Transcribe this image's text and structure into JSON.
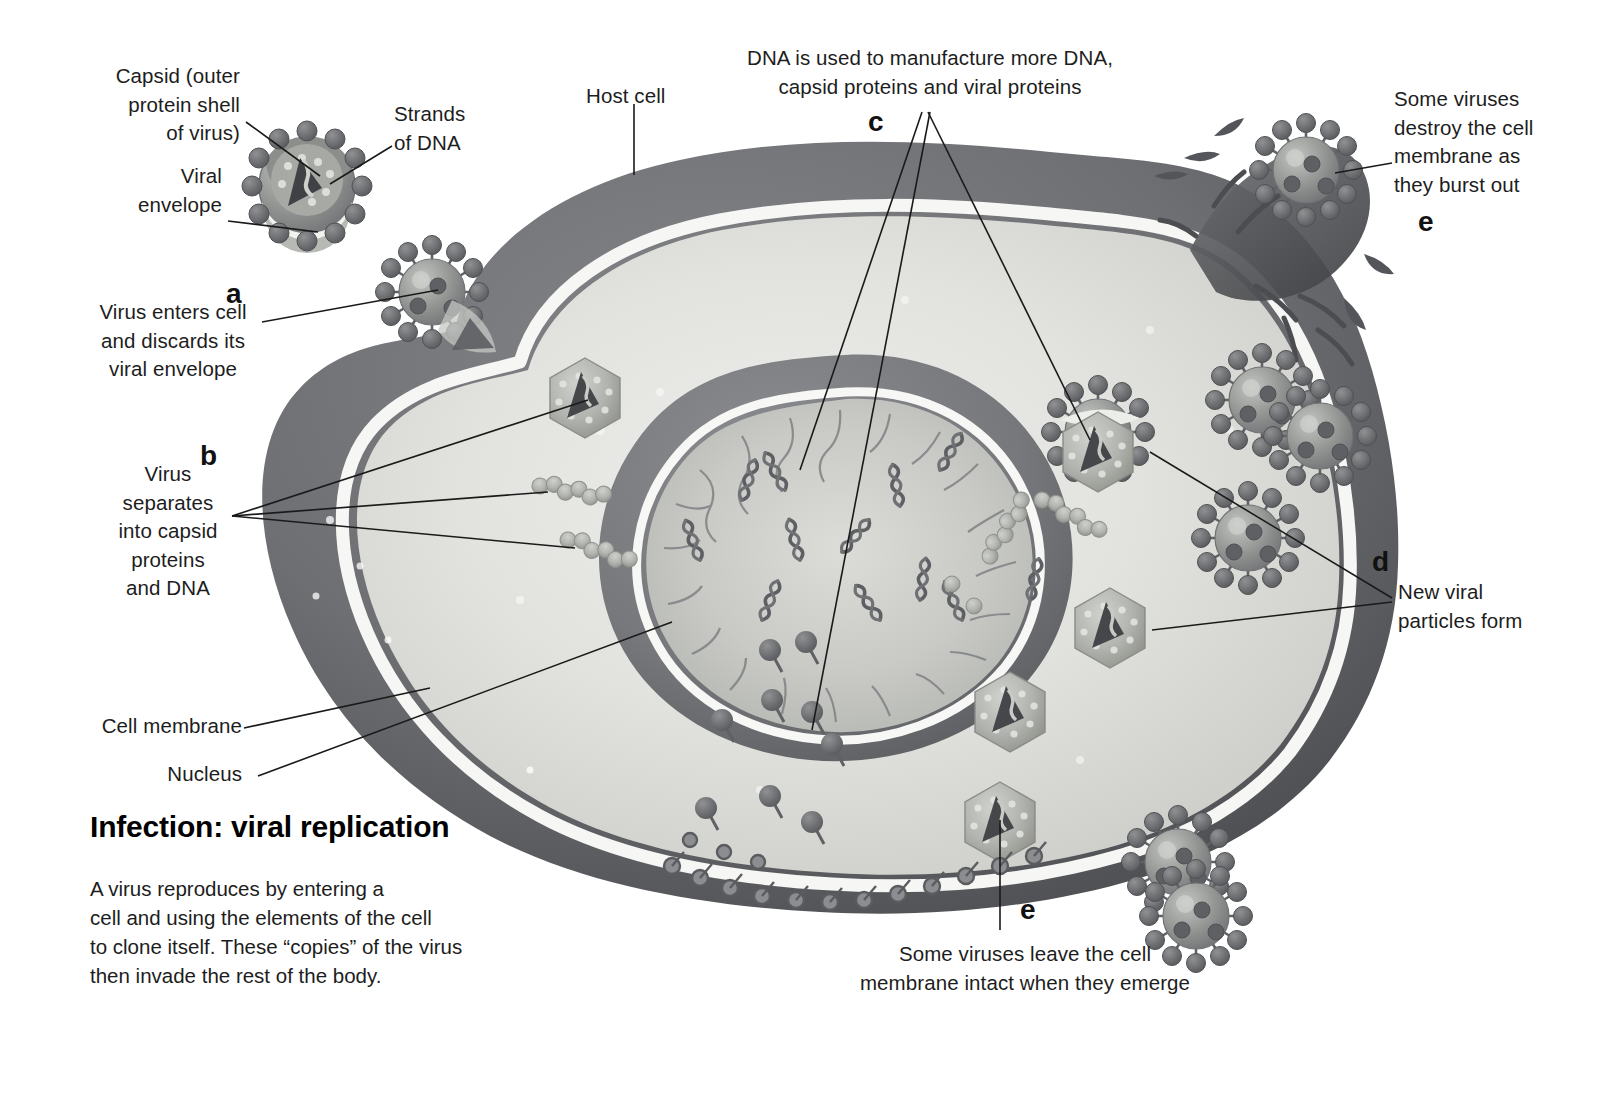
{
  "figure": {
    "title": "Infection: viral replication",
    "description": "A virus reproduces by entering a\ncell and using the elements of the cell\nto clone itself. These “copies” of the virus\nthen invade the rest of the body.",
    "domain": "biology-illustration",
    "palette": {
      "background": "#ffffff",
      "membrane_dark": "#6f7174",
      "membrane_darker": "#56585b",
      "membrane_rim": "#f4f4f2",
      "cytoplasm": "#d9dad6",
      "cytoplasm_light": "#e8e9e5",
      "nucleus_ring": "#7b7d80",
      "nucleus_inner": "#c9cac6",
      "virus_body": "#9a9c9a",
      "virus_spike": "#6e7072",
      "capsid": "#b6b8b4",
      "dna_dark": "#4a4c4e",
      "leader_line": "#1a1a1a",
      "text": "#1d1d1d"
    }
  },
  "labels": {
    "capsid": "Capsid (outer\nprotein shell\nof virus)",
    "strands_of_dna": "Strands\nof DNA",
    "viral_envelope": "Viral\nenvelope",
    "host_cell": "Host cell",
    "cell_membrane": "Cell membrane",
    "nucleus": "Nucleus",
    "virus_enters": "Virus enters cell\nand discards its\nviral envelope",
    "virus_separates": "Virus\nseparates\ninto capsid\nproteins\nand DNA",
    "dna_manufacture": "DNA is used to manufacture more DNA,\ncapsid proteins and viral proteins",
    "new_particles": "New viral\nparticles form",
    "destroy_membrane": "Some viruses\ndestroy the cell\nmembrane as\nthey burst out",
    "leave_intact": "Some viruses leave the cell\nmembrane intact when they emerge"
  },
  "keys": {
    "a": "a",
    "b": "b",
    "c": "c",
    "d": "d",
    "e_top": "e",
    "e_bottom": "e"
  },
  "steps": [
    {
      "key": "a",
      "text": "Virus enters cell and discards its viral envelope"
    },
    {
      "key": "b",
      "text": "Virus separates into capsid proteins and DNA"
    },
    {
      "key": "c",
      "text": "DNA is used to manufacture more DNA, capsid proteins and viral proteins"
    },
    {
      "key": "d",
      "text": "New viral particles form"
    },
    {
      "key": "e",
      "text": "Some viruses destroy the cell membrane as they burst out"
    },
    {
      "key": "e",
      "text": "Some viruses leave the cell membrane intact when they emerge"
    }
  ]
}
